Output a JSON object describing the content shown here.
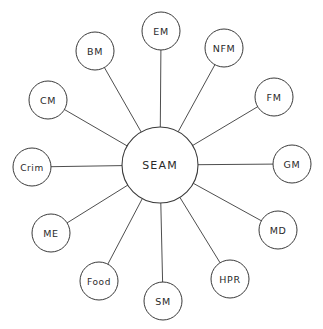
{
  "diagram": {
    "type": "hub-and-spoke",
    "colors": {
      "stroke": "#3a3a3a",
      "fill": "#ffffff",
      "text": "#2a2a2a"
    },
    "center": {
      "label": "SEAM",
      "x": 160,
      "y": 165,
      "r": 38
    },
    "nodes": [
      {
        "label": "EM",
        "x": 161,
        "y": 31,
        "r": 19
      },
      {
        "label": "NFM",
        "x": 224,
        "y": 48,
        "r": 19
      },
      {
        "label": "FM",
        "x": 274,
        "y": 97,
        "r": 19
      },
      {
        "label": "GM",
        "x": 292,
        "y": 164,
        "r": 19
      },
      {
        "label": "MD",
        "x": 278,
        "y": 230,
        "r": 19
      },
      {
        "label": "HPR",
        "x": 230,
        "y": 279,
        "r": 19
      },
      {
        "label": "SM",
        "x": 163,
        "y": 301,
        "r": 19
      },
      {
        "label": "Food",
        "x": 99,
        "y": 281,
        "r": 19
      },
      {
        "label": "ME",
        "x": 51,
        "y": 233,
        "r": 19
      },
      {
        "label": "Crim",
        "x": 32,
        "y": 167,
        "r": 19
      },
      {
        "label": "CM",
        "x": 48,
        "y": 100,
        "r": 19
      },
      {
        "label": "BM",
        "x": 95,
        "y": 51,
        "r": 19
      }
    ]
  }
}
